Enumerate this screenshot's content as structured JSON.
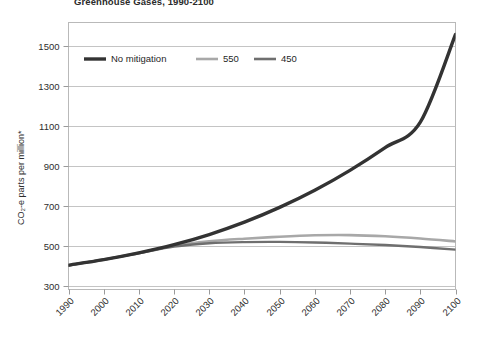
{
  "chart_data": {
    "type": "line",
    "title": "Greenhouse Gases, 1990-2100",
    "xlabel": "",
    "ylabel": "CO₂-e parts per million*",
    "x": [
      1990,
      2000,
      2010,
      2020,
      2030,
      2040,
      2050,
      2060,
      2070,
      2080,
      2090,
      2100
    ],
    "xtick_labels": [
      "1990",
      "2000",
      "2010",
      "2020",
      "2030",
      "2040",
      "2050",
      "2060",
      "2070",
      "2080",
      "2090",
      "2100"
    ],
    "ytick_labels": [
      "300",
      "500",
      "700",
      "900",
      "1100",
      "1300",
      "1500"
    ],
    "ytick_values": [
      300,
      500,
      700,
      900,
      1100,
      1300,
      1500
    ],
    "xlim": [
      1990,
      2100
    ],
    "ylim": [
      280,
      1620
    ],
    "grid": "horizontal",
    "legend_position": "top-left-inside",
    "series": [
      {
        "name": "No mitigation",
        "color": "#333333",
        "width": 3.4,
        "values": [
          402,
          430,
          464,
          505,
          556,
          618,
          692,
          778,
          878,
          992,
          1120,
          1560
        ]
      },
      {
        "name": "550",
        "color": "#a8a8a8",
        "width": 2.6,
        "values": [
          402,
          430,
          464,
          500,
          522,
          535,
          545,
          552,
          553,
          547,
          536,
          521
        ]
      },
      {
        "name": "450",
        "color": "#6f6f6f",
        "width": 2.4,
        "values": [
          402,
          430,
          462,
          495,
          512,
          518,
          519,
          516,
          510,
          503,
          493,
          480
        ]
      }
    ],
    "legend": [
      {
        "label": "No mitigation",
        "color": "#333333"
      },
      {
        "label": "550",
        "color": "#a8a8a8"
      },
      {
        "label": "450",
        "color": "#6f6f6f"
      }
    ]
  }
}
